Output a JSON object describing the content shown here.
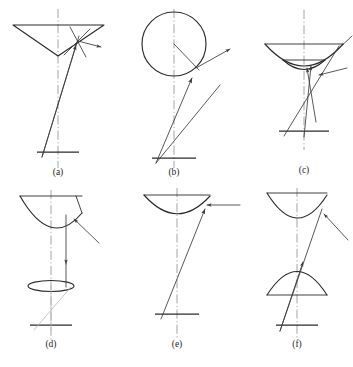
{
  "figure": {
    "caption": "",
    "width": 353,
    "height": 367,
    "background": "#ffffff",
    "line_color": "#2b2b2b",
    "ray_color": "#3a3a3a",
    "axis_color": "#8e8e8e",
    "faint_color": "#b9b9b9"
  },
  "panels": [
    {
      "id": "a",
      "label": "(a)",
      "label_x": 58,
      "label_y": 175,
      "reflector": "inverted-cone-v-reflector",
      "description": "Wide inverted V (conical) reflector with oblique incident ray, reflected ray to the right and a normal line at the reflection point.",
      "axis_x": 58,
      "ground_y": 152
    },
    {
      "id": "b",
      "label": "(b)",
      "label_x": 174,
      "label_y": 175,
      "reflector": "spherical-reflector",
      "description": "Circular (spherical) reflector with radius line drawn from centre to the oblique ray intersection on the rim.",
      "axis_x": 174,
      "ground_y": 158
    },
    {
      "id": "c",
      "label": "(c)",
      "label_x": 304,
      "label_y": 173,
      "reflector": "cassegrain-dual-reflector",
      "description": "Concave primary dish with small concave sub-reflector beneath; two converging rays to the focus plus an oblique incident ray.",
      "axis_x": 304,
      "ground_y": 131
    },
    {
      "id": "d",
      "label": "(d)",
      "label_x": 51,
      "label_y": 347,
      "reflector": "parabolic-with-lens-disk",
      "description": "Deep parabolic reflector with a flattened elliptical lens/disk on the axis below it; vertical ray from rim through the disk.",
      "axis_x": 51,
      "ground_y": 325
    },
    {
      "id": "e",
      "label": "(e)",
      "label_x": 177,
      "label_y": 347,
      "reflector": "offset-parabolic-reflector",
      "description": "Shallow parabolic reflector with a horizontal incident ray arriving from the right and an oblique reflected ray down to the base.",
      "axis_x": 177,
      "ground_y": 314
    },
    {
      "id": "f",
      "label": "(f)",
      "label_x": 297,
      "label_y": 347,
      "reflector": "gregorian-dual-reflector",
      "description": "Concave primary reflector above a convex dome sub-reflector; oblique incident ray crosses both down to the base.",
      "axis_x": 297,
      "ground_y": 325
    }
  ]
}
